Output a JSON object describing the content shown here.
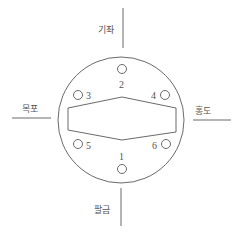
{
  "diagram": {
    "type": "round-table-seating-with-directions",
    "colors": {
      "stroke": "#6a6a6a",
      "text": "#555555",
      "background": "#ffffff"
    },
    "directions": {
      "top": {
        "label": "기좌"
      },
      "left": {
        "label": "목포"
      },
      "right": {
        "label": "홍도"
      },
      "bottom": {
        "label": "팔금"
      }
    },
    "table_shape": "hexagon",
    "seats": [
      {
        "id": "1",
        "label": "1",
        "position": "bottom"
      },
      {
        "id": "2",
        "label": "2",
        "position": "top"
      },
      {
        "id": "3",
        "label": "3",
        "position": "upper-left"
      },
      {
        "id": "4",
        "label": "4",
        "position": "upper-right"
      },
      {
        "id": "5",
        "label": "5",
        "position": "lower-left"
      },
      {
        "id": "6",
        "label": "6",
        "position": "lower-right"
      }
    ]
  }
}
